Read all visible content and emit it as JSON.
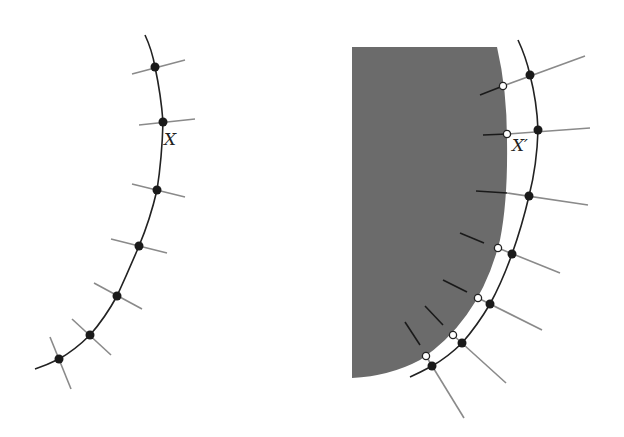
{
  "labels": {
    "left_point": "X",
    "right_point": "X′"
  },
  "colors": {
    "curve": "#222222",
    "tick": "#888888",
    "dot": "#1a1a1a",
    "region": "#6b6b6b",
    "inner_tick": "#1a1a1a"
  },
  "left_panel": {
    "description": "Curve with 7 sample points and perpendicular tick lines",
    "point_count": 7,
    "labeled_point_index": 1
  },
  "right_panel": {
    "description": "Curve with 7 sample points, normals projected onto a shaded region boundary (open circles)",
    "point_count": 7,
    "labeled_point_index": 1
  }
}
